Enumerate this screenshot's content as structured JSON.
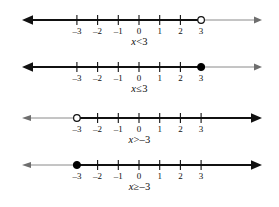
{
  "figure": {
    "background_color": "#ffffff",
    "line_color": "#111111",
    "shaded_color": "#000000",
    "unshaded_color": "#6e6e6e",
    "axis": {
      "left_x": 22,
      "right_x": 262,
      "zero_x": 139,
      "unit_px": 20.7
    }
  },
  "numberlines": [
    {
      "id": "line-1",
      "caption_var": "x",
      "caption_relation": "<",
      "caption_value": "3",
      "caption_text": "x < 3",
      "tick_labels": [
        "–3",
        "–2",
        "–1",
        "0",
        "1",
        "2",
        "3"
      ],
      "tick_values": [
        -3,
        -2,
        -1,
        0,
        1,
        2,
        3
      ],
      "endpoint_value": 3,
      "endpoint_type": "open",
      "shaded_direction": "left",
      "shaded_arrow": "left",
      "plain_arrow": "right"
    },
    {
      "id": "line-2",
      "caption_var": "x",
      "caption_relation": "≤",
      "caption_value": "3",
      "caption_text": "x ≤ 3",
      "tick_labels": [
        "–3",
        "–2",
        "–1",
        "0",
        "1",
        "2",
        "3"
      ],
      "tick_values": [
        -3,
        -2,
        -1,
        0,
        1,
        2,
        3
      ],
      "endpoint_value": 3,
      "endpoint_type": "closed",
      "shaded_direction": "left",
      "shaded_arrow": "left",
      "plain_arrow": "right"
    },
    {
      "id": "line-3",
      "caption_var": "x",
      "caption_relation": ">",
      "caption_value": "–3",
      "caption_text": "x > –3",
      "tick_labels": [
        "–3",
        "–2",
        "–1",
        "0",
        "1",
        "2",
        "3"
      ],
      "tick_values": [
        -3,
        -2,
        -1,
        0,
        1,
        2,
        3
      ],
      "endpoint_value": -3,
      "endpoint_type": "open",
      "shaded_direction": "right",
      "shaded_arrow": "right",
      "plain_arrow": "left"
    },
    {
      "id": "line-4",
      "caption_var": "x",
      "caption_relation": "≥",
      "caption_value": "–3",
      "caption_text": "x ≥ –3",
      "tick_labels": [
        "–3",
        "–2",
        "–1",
        "0",
        "1",
        "2",
        "3"
      ],
      "tick_values": [
        -3,
        -2,
        -1,
        0,
        1,
        2,
        3
      ],
      "endpoint_value": -3,
      "endpoint_type": "closed",
      "shaded_direction": "right",
      "shaded_arrow": "right",
      "plain_arrow": "left"
    }
  ]
}
